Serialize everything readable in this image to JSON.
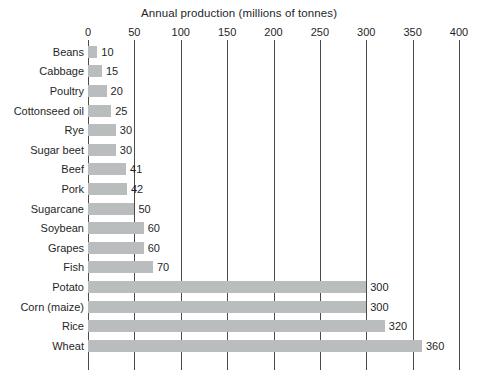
{
  "chart_data": {
    "type": "bar",
    "orientation": "horizontal",
    "title": "Annual production  (millions of tonnes)",
    "xlabel": "",
    "ylabel": "",
    "xlim": [
      0,
      400
    ],
    "xticks": [
      0,
      50,
      100,
      150,
      200,
      250,
      300,
      350,
      400
    ],
    "xtick_labels": [
      "0",
      "50",
      "100",
      "150",
      "200",
      "250",
      "300",
      "350",
      "400"
    ],
    "grid": true,
    "legend": null,
    "bar_color": "#b9bdbe",
    "gridline_color": "#4a4a4a",
    "categories": [
      "Beans",
      "Cabbage",
      "Poultry",
      "Cottonseed oil",
      "Rye",
      "Sugar beet",
      "Beef",
      "Pork",
      "Sugarcane",
      "Soybean",
      "Grapes",
      "Fish",
      "Potato",
      "Corn (maize)",
      "Rice",
      "Wheat"
    ],
    "values": [
      10,
      15,
      20,
      25,
      30,
      30,
      41,
      42,
      50,
      60,
      60,
      70,
      300,
      300,
      320,
      360
    ],
    "value_labels": [
      "10",
      "15",
      "20",
      "25",
      "30",
      "30",
      "41",
      "42",
      "50",
      "60",
      "60",
      "70",
      "300",
      "300",
      "320",
      "360"
    ]
  }
}
